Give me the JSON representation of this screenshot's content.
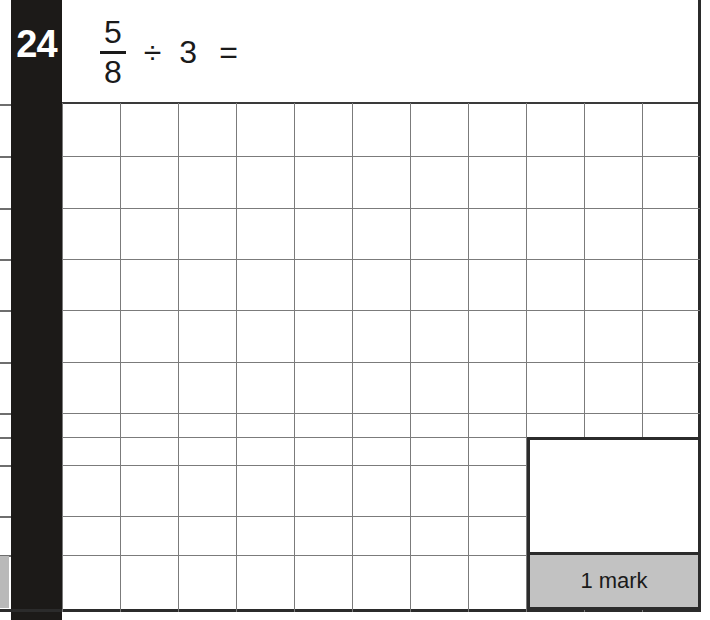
{
  "page": {
    "width": 710,
    "height": 620,
    "background_color": "#ffffff",
    "border_color": "#2b2b2b"
  },
  "question": {
    "number": "24",
    "number_bar_color": "#1c1a18",
    "number_text_color": "#ffffff",
    "expression": {
      "fraction_numerator": "5",
      "fraction_denominator": "8",
      "operator": "÷",
      "operand": "3",
      "equals": "="
    }
  },
  "answer_grid": {
    "columns": 11,
    "rows": 10,
    "line_color": "#7b7b7b",
    "cell_width": 58,
    "cell_height": 51
  },
  "mark_box": {
    "answer_area_label": "",
    "mark_label": "1 mark",
    "strip_color": "#c2c2c2",
    "border_color": "#2b2b2b"
  }
}
